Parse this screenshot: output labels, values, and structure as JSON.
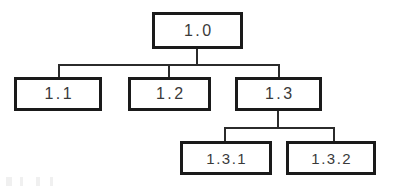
{
  "diagram": {
    "type": "tree",
    "background_color": "#ffffff",
    "box_border_color": "#1a1a1a",
    "box_fill_color": "#ffffff",
    "connector_color": "#2b2b2b",
    "text_color": "#3a3a3a",
    "nodes": [
      {
        "id": "root",
        "label": "1.0",
        "level": 0,
        "parent": null
      },
      {
        "id": "n11",
        "label": "1.1",
        "level": 1,
        "parent": "root"
      },
      {
        "id": "n12",
        "label": "1.2",
        "level": 1,
        "parent": "root"
      },
      {
        "id": "n13",
        "label": "1.3",
        "level": 1,
        "parent": "root"
      },
      {
        "id": "n131",
        "label": "1.3.1",
        "level": 2,
        "parent": "n13"
      },
      {
        "id": "n132",
        "label": "1.3.2",
        "level": 2,
        "parent": "n13"
      }
    ],
    "edges": [
      {
        "from": "root",
        "to": "n11"
      },
      {
        "from": "root",
        "to": "n12"
      },
      {
        "from": "root",
        "to": "n13"
      },
      {
        "from": "n13",
        "to": "n131"
      },
      {
        "from": "n13",
        "to": "n132"
      }
    ]
  }
}
